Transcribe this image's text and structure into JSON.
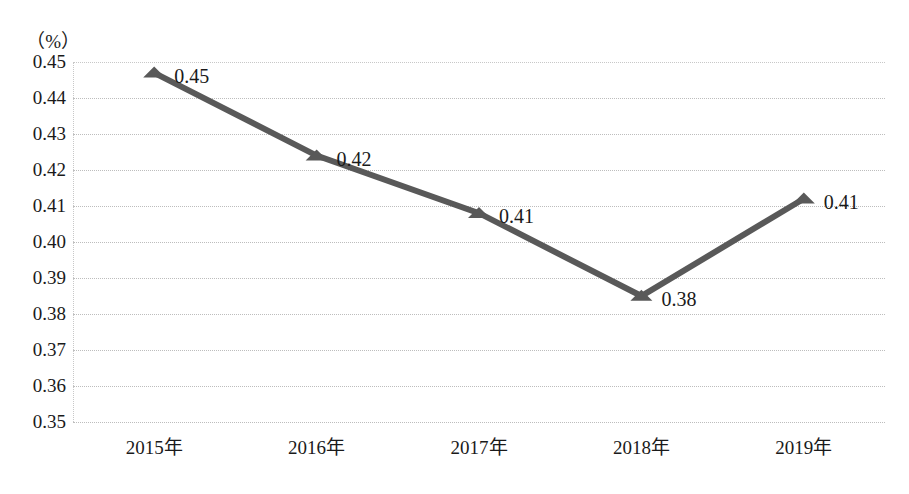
{
  "chart_data": {
    "type": "line",
    "title": "",
    "subtitle": "",
    "xlabel": "",
    "ylabel": "",
    "unit_label": "（%）",
    "categories": [
      "2015年",
      "2016年",
      "2017年",
      "2018年",
      "2019年"
    ],
    "values": [
      0.45,
      0.42,
      0.41,
      0.38,
      0.41
    ],
    "plotted_values": [
      0.447,
      0.424,
      0.408,
      0.385,
      0.412
    ],
    "point_labels": [
      "0.45",
      "0.42",
      "0.41",
      "0.38",
      "0.41"
    ],
    "ylim": [
      0.35,
      0.45
    ],
    "ytick_step": 0.01,
    "ytick_labels": [
      "0.45",
      "0.44",
      "0.43",
      "0.42",
      "0.41",
      "0.40",
      "0.39",
      "0.38",
      "0.37",
      "0.36",
      "0.35"
    ],
    "ytick_values": [
      0.45,
      0.44,
      0.43,
      0.42,
      0.41,
      0.4,
      0.39,
      0.38,
      0.37,
      0.36,
      0.35
    ],
    "grid": true,
    "grid_style": "dotted",
    "legend": false,
    "legend_position": "none",
    "series": [
      {
        "name": "",
        "values": [
          0.45,
          0.42,
          0.41,
          0.38,
          0.41
        ],
        "line_color": "#595959",
        "marker": "triangle",
        "marker_color": "#595959"
      }
    ],
    "colors": {
      "line": "#595959",
      "marker": "#595959",
      "grid": "#bdbdbd",
      "axis": "#c8c8c8",
      "text": "#1a1a1a",
      "background": "#ffffff"
    }
  }
}
